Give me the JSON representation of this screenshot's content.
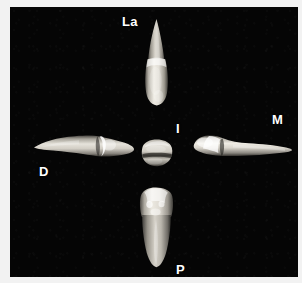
{
  "figure": {
    "type": "anatomical-photograph-plate",
    "background_color": "#050505",
    "page_color": "#f2f2f2",
    "label_color": "#ffffff",
    "specimen_color": "#e8e6e0"
  },
  "labels": {
    "labial": "La",
    "incisal": "I",
    "mesial": "M",
    "distal": "D",
    "palatal": "P"
  },
  "views": [
    {
      "key": "labial",
      "label": "La",
      "position": "top",
      "icon": "tooth-labial-view-icon",
      "orientation": "vertical-root-up"
    },
    {
      "key": "distal",
      "label": "D",
      "position": "left",
      "icon": "tooth-distal-view-icon",
      "orientation": "horizontal-root-left"
    },
    {
      "key": "incisal",
      "label": "I",
      "position": "center",
      "icon": "tooth-incisal-view-icon",
      "orientation": "occlusal-outline"
    },
    {
      "key": "mesial",
      "label": "M",
      "position": "right",
      "icon": "tooth-mesial-view-icon",
      "orientation": "horizontal-root-right"
    },
    {
      "key": "palatal",
      "label": "P",
      "position": "bottom",
      "icon": "tooth-palatal-view-icon",
      "orientation": "vertical-root-down"
    }
  ]
}
